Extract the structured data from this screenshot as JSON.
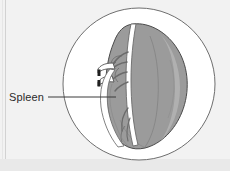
{
  "figure": {
    "type": "anatomical-illustration",
    "subject": "spleen",
    "view": "circular-inset-view",
    "background_color": "#f2f2f2",
    "canvas": {
      "width": 230,
      "height": 171
    }
  },
  "labels": [
    {
      "id": "spleen",
      "text": "Spleen",
      "text_x": 9,
      "text_y": 101,
      "leader_from_x": 48,
      "leader_from_y": 97,
      "leader_to_x": 116,
      "leader_to_y": 97,
      "color": "#2b2b2b"
    }
  ],
  "circle_frame": {
    "center_x": 139,
    "center_y": 84,
    "radius": 76,
    "fill": "#ffffff",
    "stroke": "#6e6e6e",
    "stroke_width": 1
  },
  "organ": {
    "name": "spleen-body",
    "fill": "#9b9b9b",
    "stroke": "#4a4a4a",
    "stroke_width": 1,
    "capsule_highlight": "#b5b5b5"
  },
  "vessels": {
    "name": "splenic-vasculature",
    "fill": "#ffffff",
    "stroke": "#6b6b6b",
    "stroke_width": 0.9,
    "description": "splenic artery and vein branching at hilum"
  },
  "pedicle": {
    "name": "vascular-pedicle",
    "fill": "#ffffff",
    "stroke": "#555555"
  },
  "clips": {
    "name": "ligature-clips",
    "count": 2,
    "fill": "#1f1f1f",
    "positions": [
      {
        "x": 98,
        "y": 70,
        "width": 3,
        "height": 6
      },
      {
        "x": 98,
        "y": 80,
        "width": 3,
        "height": 6
      }
    ]
  },
  "edge_bands": {
    "left_rule_x": 5,
    "left_rule_color": "#cfcfcf",
    "bottom_band_y": 159,
    "bottom_band_color": "#e4e4e4"
  }
}
